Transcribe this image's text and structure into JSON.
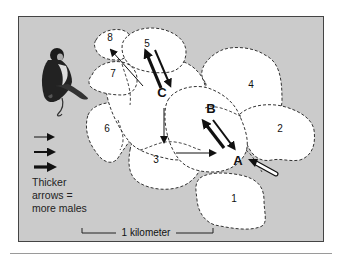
{
  "figure": {
    "ranges": [
      {
        "id": "1",
        "label": "1"
      },
      {
        "id": "2",
        "label": "2"
      },
      {
        "id": "3",
        "label": "3"
      },
      {
        "id": "4",
        "label": "4"
      },
      {
        "id": "5",
        "label": "5"
      },
      {
        "id": "6",
        "label": "6"
      },
      {
        "id": "7",
        "label": "7"
      },
      {
        "id": "8",
        "label": "8"
      }
    ],
    "group_labels": [
      {
        "id": "A",
        "label": "A"
      },
      {
        "id": "B",
        "label": "B"
      },
      {
        "id": "C",
        "label": "C"
      }
    ],
    "movements": [
      {
        "from": "C",
        "to": "8",
        "thickness": "thin"
      },
      {
        "from": "C",
        "to": "5",
        "thickness": "thick"
      },
      {
        "from": "5",
        "to": "C",
        "thickness": "medium"
      },
      {
        "from": "C",
        "to": "3",
        "thickness": "thin"
      },
      {
        "from": "3",
        "to": "A",
        "thickness": "thin"
      },
      {
        "from": "A",
        "to": "B",
        "thickness": "thick"
      },
      {
        "from": "B",
        "to": "A",
        "thickness": "medium"
      },
      {
        "from": "outside",
        "to": "A",
        "thickness": "open"
      }
    ],
    "legend": {
      "arrow_sizes": [
        "thin",
        "medium",
        "thick"
      ],
      "text_lines": [
        "Thicker",
        "arrows =",
        "more males"
      ]
    },
    "scale_bar": {
      "label": "1 kilometer"
    },
    "illustration": "monkey"
  }
}
